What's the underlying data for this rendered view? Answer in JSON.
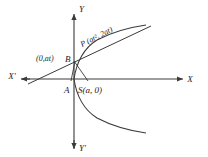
{
  "figure": {
    "kind": "coordinate-geometry-diagram",
    "stroke_color": "#3a3a3a",
    "text_color": "#1d1d1d",
    "background": "#ffffff"
  },
  "axes": {
    "x_positive_label": "X",
    "x_negative_label": "X'",
    "y_positive_label": "Y",
    "y_negative_label": "Y'",
    "origin_px": {
      "x": 74,
      "y": 79
    }
  },
  "points": [
    {
      "name": "A",
      "label": "A",
      "role": "vertex",
      "px": {
        "x": 74,
        "y": 79
      },
      "label_px": {
        "x": 66,
        "y": 91
      }
    },
    {
      "name": "B",
      "label": "B",
      "role": "y-axis-intersection-of-tangent",
      "coordinate_label": "(0,at)",
      "px": {
        "x": 74,
        "y": 60
      },
      "label_px": {
        "x": 66,
        "y": 58
      },
      "coordinate_label_px": {
        "x": 36,
        "y": 58
      }
    },
    {
      "name": "S",
      "label": "S(a, 0)",
      "role": "focus",
      "px": {
        "x": 86,
        "y": 79
      },
      "label_px": {
        "x": 80,
        "y": 91
      }
    },
    {
      "name": "P",
      "label": "P",
      "role": "point-on-parabola",
      "coordinate_label": "(at², 2at)",
      "full_label": "P (at², 2at)",
      "px": {
        "x": 116,
        "y": 46
      },
      "label_px": {
        "x": 82,
        "y": 48
      },
      "label_rotation_deg": -33
    }
  ],
  "curves": [
    {
      "name": "parabola-upper-branch",
      "equation": "y² = 4ax",
      "opens": "right"
    },
    {
      "name": "parabola-lower-branch",
      "equation": "y² = 4ax",
      "opens": "right"
    }
  ],
  "lines": [
    {
      "name": "tangent-line",
      "through": [
        "B",
        "P"
      ],
      "from_px": {
        "x": 28,
        "y": 85
      },
      "to_px": {
        "x": 152,
        "y": 26
      }
    },
    {
      "name": "segment-B-to-S",
      "through": [
        "B",
        "S"
      ],
      "from_px": {
        "x": 74,
        "y": 60
      },
      "to_px": {
        "x": 88,
        "y": 80
      }
    },
    {
      "name": "segment-B-to-A",
      "through": [
        "B",
        "A"
      ],
      "from_px": {
        "x": 74,
        "y": 60
      },
      "to_px": {
        "x": 72,
        "y": 80
      }
    }
  ]
}
